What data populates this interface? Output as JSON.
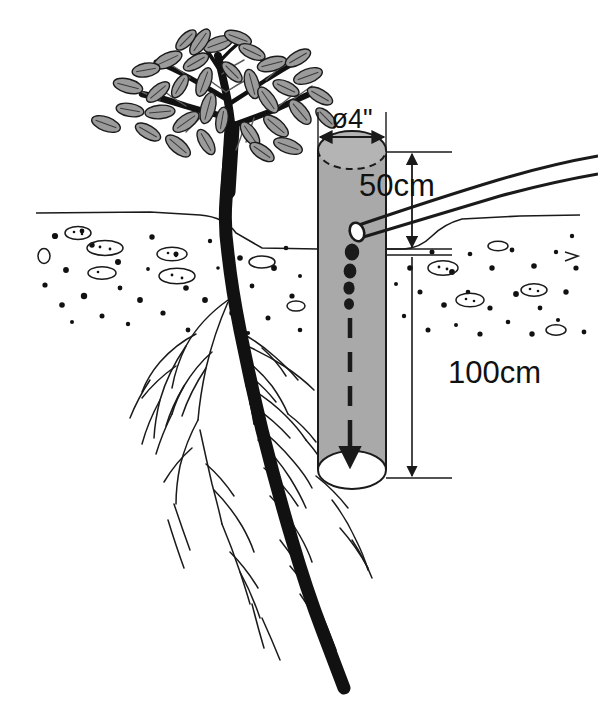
{
  "diagram": {
    "colors": {
      "ink": "#1a1a1a",
      "pipe_fill": "#a9a9a9",
      "leaf_fill": "#9b9b9b",
      "trunk": "#111111",
      "background": "#ffffff",
      "soil_particle": "#111111"
    },
    "labels": {
      "diameter": "ø4\"",
      "above_ground_depth": "50cm",
      "below_ground_depth": "100cm"
    },
    "measurements": {
      "pipe_diameter_inches": 4,
      "pipe_exposed_height_cm": 50,
      "pipe_buried_depth_cm": 100
    },
    "elements": {
      "tree_label": "tree",
      "canopy_label": "leaf-canopy",
      "trunk_label": "trunk",
      "root_label": "root-system",
      "pipe_label": "watering-pipe",
      "hose_label": "garden-hose",
      "droplets_label": "water-droplets",
      "flow_label": "water-flow-arrow",
      "soil_label": "soil-cross-section",
      "ground_label": "ground-line"
    },
    "droplets": [
      {
        "cx": 352,
        "cy": 252,
        "rx": 7.2,
        "ry": 8.6
      },
      {
        "cx": 350,
        "cy": 271,
        "rx": 6.4,
        "ry": 7.6
      },
      {
        "cx": 349,
        "cy": 288,
        "rx": 5.6,
        "ry": 6.6
      },
      {
        "cx": 349,
        "cy": 304,
        "rx": 5.0,
        "ry": 5.8
      }
    ]
  }
}
